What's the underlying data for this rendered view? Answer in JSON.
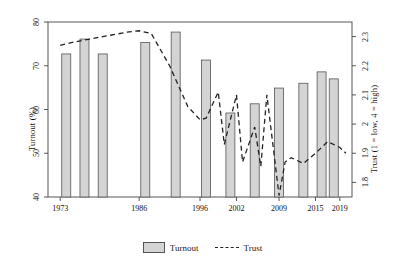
{
  "chart_data": {
    "type": "bar",
    "title": "",
    "xlabel": "",
    "ylabel": "Turnout (%)",
    "ylabel_right": "Trust (1 = low, 4 = high)",
    "ylim": [
      40,
      80
    ],
    "ylim_right": [
      1.75,
      2.35
    ],
    "xlim": [
      1971,
      2021
    ],
    "grid": false,
    "legend_position": "bottom",
    "x_tick_labels": [
      "1973",
      "1986",
      "1996",
      "2002",
      "2009",
      "2015",
      "2019"
    ],
    "x_tick_values": [
      1973,
      1986,
      1996,
      2002,
      2009,
      2015,
      2019
    ],
    "y_tick_labels": [
      "40",
      "50",
      "60",
      "70",
      "80"
    ],
    "y_tick_values": [
      40,
      50,
      60,
      70,
      80
    ],
    "y_right_tick_labels": [
      "1.8",
      "1.9",
      "2",
      "2.1",
      "2.2",
      "2.3"
    ],
    "y_right_tick_values": [
      1.8,
      1.9,
      2.0,
      2.1,
      2.2,
      2.3
    ],
    "series": [
      {
        "name": "Turnout",
        "type": "bar",
        "axis": "left",
        "color": "#d4d4d4",
        "edge_color": "#555555",
        "x": [
          1974,
          1977,
          1980,
          1987,
          1992,
          1997,
          2001,
          2005,
          2009,
          2013,
          2016,
          2018
        ],
        "categories": [
          "1974",
          "1977",
          "1980",
          "1987",
          "1992",
          "1997",
          "2001",
          "2005",
          "2009",
          "2013",
          "2016",
          "2018"
        ],
        "values": [
          72.7,
          76.1,
          72.7,
          75.3,
          77.7,
          71.3,
          59.2,
          61.3,
          64.9,
          66.0,
          68.6,
          67.0
        ]
      },
      {
        "name": "Trust",
        "type": "line",
        "axis": "right",
        "style": "dashed",
        "color": "#222222",
        "x": [
          1973,
          1975,
          1980,
          1984,
          1986,
          1988,
          1991,
          1994,
          1996,
          1997,
          1999,
          2000,
          2002,
          2003,
          2005,
          2006,
          2007,
          2009,
          2010,
          2011,
          2013,
          2015,
          2017,
          2019,
          2020
        ],
        "values": [
          2.27,
          2.28,
          2.3,
          2.315,
          2.32,
          2.31,
          2.2,
          2.06,
          2.015,
          2.02,
          2.11,
          1.93,
          2.1,
          1.87,
          1.99,
          1.855,
          2.1,
          1.755,
          1.87,
          1.885,
          1.865,
          1.9,
          1.94,
          1.92,
          1.9
        ]
      }
    ]
  },
  "legend": {
    "items": [
      {
        "label": "Turnout",
        "marker": "swatch"
      },
      {
        "label": "Trust",
        "marker": "dashed-line"
      }
    ]
  }
}
